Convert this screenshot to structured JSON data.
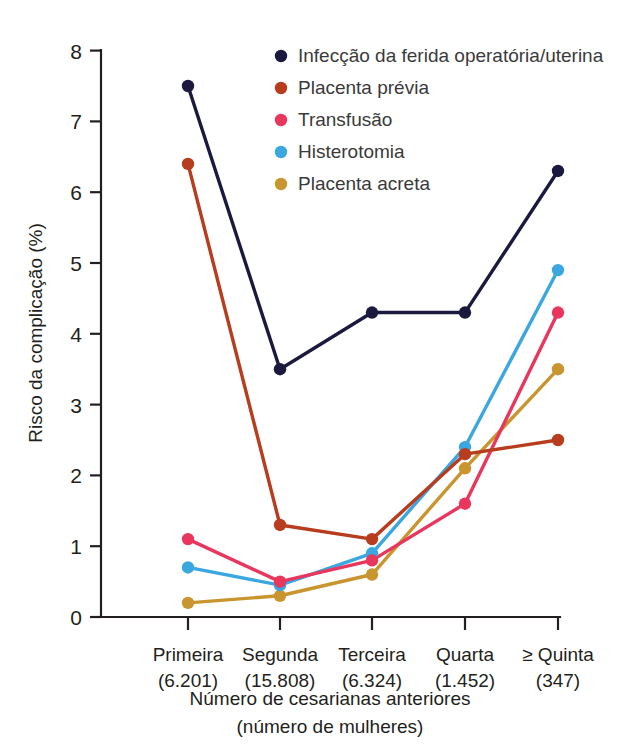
{
  "chart_data": {
    "type": "line",
    "title": "",
    "subtitle": "",
    "xlabel": "Número de cesarianas anteriores",
    "xlabel_sub": "(número de mulheres)",
    "ylabel": "Risco da complicação (%)",
    "ylim": [
      0,
      8
    ],
    "yticks": [
      "0",
      "1",
      "2",
      "3",
      "4",
      "5",
      "6",
      "7",
      "8"
    ],
    "grid": false,
    "legend_position": "top-center-right",
    "categories": [
      "Primeira",
      "Segunda",
      "Terceira",
      "Quarta",
      "≥ Quinta"
    ],
    "category_counts": [
      "(6.201)",
      "(15.808)",
      "(6.324)",
      "(1.452)",
      "(347)"
    ],
    "series": [
      {
        "name": "Infecção da ferida operatória/uterina",
        "color": "#1b1a3e",
        "values": [
          7.5,
          3.5,
          4.3,
          4.3,
          6.3
        ]
      },
      {
        "name": "Placenta prévia",
        "color": "#b83c1e",
        "values": [
          6.4,
          1.3,
          1.1,
          2.3,
          2.5
        ]
      },
      {
        "name": "Transfusão",
        "color": "#e8365d",
        "values": [
          1.1,
          0.5,
          0.8,
          1.6,
          4.3
        ]
      },
      {
        "name": "Histerotomia",
        "color": "#3aa7e0",
        "values": [
          0.7,
          0.45,
          0.9,
          2.4,
          4.9
        ]
      },
      {
        "name": "Placenta acreta",
        "color": "#c8952e",
        "values": [
          0.2,
          0.3,
          0.6,
          2.1,
          3.5
        ]
      }
    ]
  },
  "colors": {
    "background": "#ffffff",
    "axis": "#231f20",
    "text": "#231f20",
    "legend_text": "#3a3a3a"
  }
}
